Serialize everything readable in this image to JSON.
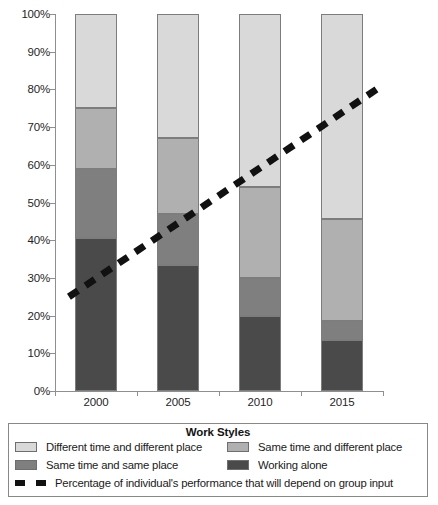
{
  "chart_data": {
    "type": "bar",
    "stacked": true,
    "title": "",
    "xlabel": "",
    "ylabel": "",
    "categories": [
      "2000",
      "2005",
      "2010",
      "2015"
    ],
    "ylim": [
      0,
      100
    ],
    "ytick_labels": [
      "0%",
      "10%",
      "20%",
      "30%",
      "40%",
      "50%",
      "60%",
      "70%",
      "80%",
      "90%",
      "100%"
    ],
    "ytick_values": [
      0,
      10,
      20,
      30,
      40,
      50,
      60,
      70,
      80,
      90,
      100
    ],
    "grid": false,
    "legend_position": "bottom",
    "legend_title": "Work Styles",
    "series": [
      {
        "name": "Working alone",
        "color": "#4a4a4a",
        "values": [
          40.5,
          33.5,
          20.0,
          13.5
        ]
      },
      {
        "name": "Same time and same place",
        "color": "#7f7f7f",
        "values": [
          18.5,
          13.5,
          10.0,
          5.0
        ]
      },
      {
        "name": "Same time and different place",
        "color": "#b0b0b0",
        "values": [
          16.0,
          20.0,
          24.0,
          27.0
        ]
      },
      {
        "name": "Different time and different place",
        "color": "#d9d9d9",
        "values": [
          25.0,
          33.0,
          46.0,
          54.5
        ]
      }
    ],
    "stack_order_bottom_to_top": [
      "Working alone",
      "Same time and same place",
      "Same time and different place",
      "Different time and different place"
    ],
    "trend_line": {
      "name": "Percentage of individual's performance that will depend on group input",
      "style": "dashed",
      "color": "#111111",
      "x_start_category_fraction": -0.33,
      "x_end_category_fraction": 3.42,
      "y_start": 25.0,
      "y_end": 80.0
    }
  },
  "axis": {
    "y_labels": [
      "100%",
      "90%",
      "80%",
      "70%",
      "60%",
      "50%",
      "40%",
      "30%",
      "20%",
      "10%",
      "0%"
    ],
    "x_labels": [
      "2000",
      "2005",
      "2010",
      "2015"
    ]
  },
  "legend": {
    "title": "Work Styles",
    "entries": [
      {
        "label": "Different time and different place",
        "color": "#d9d9d9"
      },
      {
        "label": "Same time and different place",
        "color": "#b0b0b0"
      },
      {
        "label": "Same time and same place",
        "color": "#7f7f7f"
      },
      {
        "label": "Working alone",
        "color": "#4a4a4a"
      }
    ],
    "line_entry": {
      "label": "Percentage of individual's performance that will depend on group input",
      "color": "#111111"
    }
  }
}
